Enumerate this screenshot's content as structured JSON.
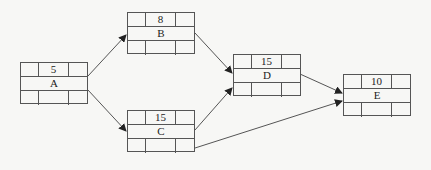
{
  "diagram": {
    "type": "activity-on-node network",
    "nodes": [
      {
        "id": "A",
        "name": "A",
        "duration": "5",
        "x": 20,
        "y": 62
      },
      {
        "id": "B",
        "name": "B",
        "duration": "8",
        "x": 127,
        "y": 12
      },
      {
        "id": "C",
        "name": "C",
        "duration": "15",
        "x": 127,
        "y": 110
      },
      {
        "id": "D",
        "name": "D",
        "duration": "15",
        "x": 233,
        "y": 54
      },
      {
        "id": "E",
        "name": "E",
        "duration": "10",
        "x": 343,
        "y": 74
      }
    ],
    "edges": [
      {
        "from": "A",
        "to": "B"
      },
      {
        "from": "A",
        "to": "C"
      },
      {
        "from": "B",
        "to": "D"
      },
      {
        "from": "C",
        "to": "D"
      },
      {
        "from": "D",
        "to": "E"
      },
      {
        "from": "C",
        "to": "E"
      }
    ],
    "colors": {
      "line": "#555555",
      "arrow": "#222222",
      "background": "#f7f7f5",
      "text": "#222222"
    }
  }
}
